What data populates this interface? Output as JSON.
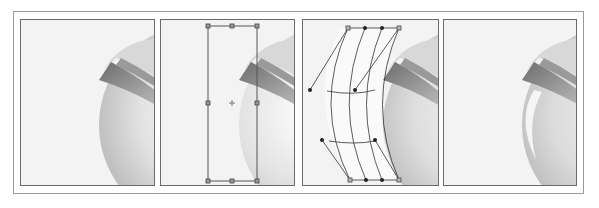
{
  "figure": {
    "panels": [
      {
        "id": "step-1",
        "label": "Original sphere with rim",
        "state": "no selection"
      },
      {
        "id": "step-2",
        "label": "Rectangle bounding box selected",
        "state": "bounding box with 8 handles and center point"
      },
      {
        "id": "step-3",
        "label": "Envelope mesh warped",
        "state": "mesh with anchor points and direction handles"
      },
      {
        "id": "step-4",
        "label": "Result with curved highlight",
        "state": "final render"
      }
    ]
  },
  "colors": {
    "background": "#ffffff",
    "panel_bg": "#f3f3f3",
    "frame": "#9a9a9a",
    "panel_border": "#6a6a6a",
    "handle": "#555555",
    "mesh_line": "#333333"
  }
}
